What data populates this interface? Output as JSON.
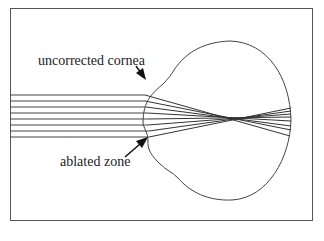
{
  "diagram": {
    "labels": {
      "top": "uncorrected cornea",
      "bottom": "ablated zone"
    },
    "colors": {
      "stroke": "#333333",
      "border": "#555555",
      "background": "#ffffff"
    },
    "ray_count": 8
  }
}
